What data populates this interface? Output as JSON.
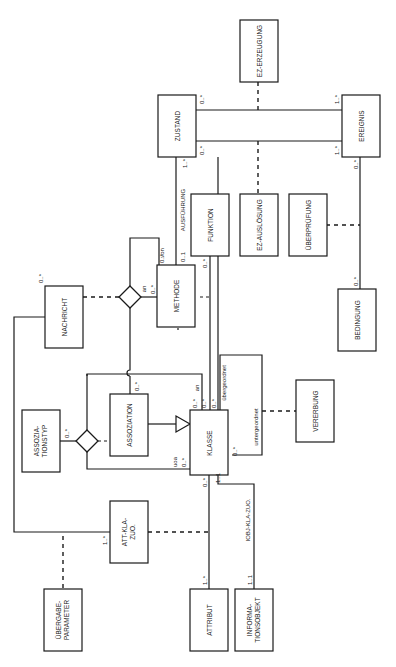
{
  "diagram": {
    "type": "UML class diagram (rotated 90°)",
    "entities": {
      "zustand": "ZUSTAND",
      "ereignis": "EREIGNIS",
      "ez_erzeugung": "EZ-ERZEUGUNG",
      "ez_ausloesung": "EZ-AUSLÖSUNG",
      "ueberpruefung": "ÜBERPRÜFUNG",
      "bedingung": "BEDINGUNG",
      "funktion": "FUNKTION",
      "methode": "METHODE",
      "nachricht": "NACHRICHT",
      "assoziation": "ASSOZIATION",
      "assoziationstyp_1": "ASSOZIA-",
      "assoziationstyp_2": "TIONSTYP",
      "klasse": "KLASSE",
      "vererbung": "VERERBUNG",
      "att_kla_zuo_1": "ATT-KLA-",
      "att_kla_zuo_2": "ZUO.",
      "uebergabe_1": "ÜBERGABE-",
      "uebergabe_2": "PARAMETER",
      "attribut": "ATTRIBUT",
      "informationsobjekt_1": "INFORMA-",
      "informationsobjekt_2": "TIONSOBJEKT"
    },
    "roles": {
      "ausfuehrung": "AUSFÜHRUNG",
      "von": "von",
      "an_methode": "an",
      "an_klasse": "an",
      "uoa": "uoa",
      "uebergeordnet": "übergeordnet",
      "untergeordnet": "untergeordnet",
      "iobj_kla_zuo": "IOBJ-KLA-ZUO."
    },
    "multiplicities": {
      "zustand_top": "0..*",
      "zustand_bottom": "0..*",
      "ereignis_top": "1..*",
      "ereignis_bottom": "1..*",
      "ereignis_bedingung": "0..*",
      "bedingung": "0..*",
      "zustand_ausfuehrung": "1..*",
      "methode_ausfuehrung": "0..1",
      "methode_von": "0..*",
      "methode_an": "0..*",
      "funktion_klasse": "0..*",
      "nachricht": "0..*",
      "assoziation": "0..*",
      "assoziationstyp": "0..*",
      "klasse_an": "0..*",
      "klasse_methode": "0..*",
      "klasse_ueber": "0..*",
      "klasse_unter": "0..*",
      "klasse_uoa": "0..*",
      "klasse_attribut": "0..*",
      "klasse_iobj": "1..1",
      "att_kla_zuo": "1..*",
      "attribut": "1..*",
      "informationsobjekt": "1..1"
    }
  }
}
